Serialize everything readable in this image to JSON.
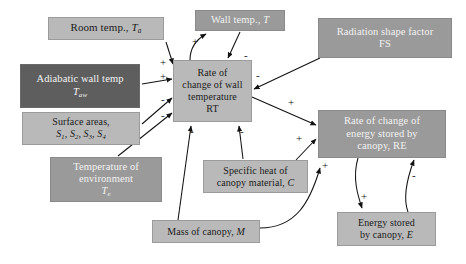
{
  "diagram": {
    "type": "causal-loop-diagram",
    "canvas": {
      "width": 466,
      "height": 264,
      "background": "#ffffff"
    },
    "palette": {
      "light_box": "#b9b9b9",
      "mid_box": "#9a9a9a",
      "dark_box": "#5e5e5e",
      "light_text": "#1b1b1b",
      "inverse_text": "#f4f4f4",
      "arrow": "#111111"
    },
    "nodes": [
      {
        "id": "room_temp",
        "name": "room-temp-node",
        "shade": "light",
        "lines": [
          "Room temp., "
        ],
        "symbol": "T",
        "symbol_sub": "a",
        "x": 48,
        "y": 17,
        "w": 116,
        "h": 23,
        "font": 11
      },
      {
        "id": "wall_temp",
        "name": "wall-temp-node",
        "shade": "mid",
        "lines": [
          "Wall temp., "
        ],
        "symbol": "T",
        "symbol_sub": "",
        "x": 195,
        "y": 10,
        "w": 90,
        "h": 21,
        "font": 10.5
      },
      {
        "id": "radiation_shape_factor",
        "name": "radiation-shape-factor-node",
        "shade": "mid",
        "lines": [
          "Radiation shape factor",
          "FS"
        ],
        "x": 318,
        "y": 18,
        "w": 134,
        "h": 40,
        "font": 10.5
      },
      {
        "id": "adiabatic_wall_temp",
        "name": "adiabatic-wall-temp-node",
        "shade": "dark",
        "lines": [
          "Adiabatic wall temp"
        ],
        "symbol": "T",
        "symbol_sub": "aw",
        "symbol_own_line": true,
        "x": 20,
        "y": 64,
        "w": 120,
        "h": 44,
        "font": 10.5
      },
      {
        "id": "rate_change_wall_temp",
        "name": "rate-of-change-wall-temperature-node",
        "shade": "light",
        "lines": [
          "Rate of",
          "change of wall",
          "temperature",
          "RT"
        ],
        "x": 173,
        "y": 60,
        "w": 79,
        "h": 62,
        "font": 10
      },
      {
        "id": "surface_areas",
        "name": "surface-areas-node",
        "shade": "light",
        "lines": [
          "Surface areas,"
        ],
        "symbols_line": [
          "S",
          "1",
          "S",
          "2",
          "S",
          "3",
          "S",
          "4"
        ],
        "x": 22,
        "y": 112,
        "w": 118,
        "h": 33,
        "font": 10
      },
      {
        "id": "rate_change_energy",
        "name": "rate-of-change-energy-stored-node",
        "shade": "mid",
        "lines": [
          "Rate of change of",
          "energy stored by",
          "canopy, RE"
        ],
        "x": 318,
        "y": 110,
        "w": 128,
        "h": 48,
        "font": 10.5
      },
      {
        "id": "temperature_environment",
        "name": "temperature-of-environment-node",
        "shade": "mid",
        "lines": [
          "Temperature of",
          "environment"
        ],
        "symbol": "T",
        "symbol_sub": "e",
        "symbol_own_line": true,
        "x": 50,
        "y": 157,
        "w": 112,
        "h": 45,
        "font": 10.5
      },
      {
        "id": "specific_heat",
        "name": "specific-heat-canopy-material-node",
        "shade": "light",
        "lines": [
          "Specific heat of",
          "canopy material, "
        ],
        "symbol": "C",
        "symbol_inline": true,
        "x": 203,
        "y": 160,
        "w": 105,
        "h": 33,
        "font": 10
      },
      {
        "id": "mass_canopy",
        "name": "mass-of-canopy-node",
        "shade": "light",
        "lines": [
          "Mass of canopy, "
        ],
        "symbol": "M",
        "symbol_inline": true,
        "x": 152,
        "y": 220,
        "w": 108,
        "h": 23,
        "font": 10
      },
      {
        "id": "energy_stored",
        "name": "energy-stored-by-canopy-node",
        "shade": "light",
        "lines": [
          "Energy stored",
          "by canopy, "
        ],
        "symbol": "E",
        "symbol_inline": true,
        "x": 337,
        "y": 212,
        "w": 99,
        "h": 34,
        "font": 10
      }
    ],
    "links": [
      {
        "id": "l1",
        "name": "link-room-temp-to-rt",
        "from": "room_temp",
        "to": "rate_change_wall_temp",
        "polarity": "+",
        "sign_x": 160,
        "sign_y": 57
      },
      {
        "id": "l2",
        "name": "link-adiabatic-wall-temp-to-rt",
        "from": "adiabatic_wall_temp",
        "to": "rate_change_wall_temp",
        "polarity": "+",
        "sign_x": 160,
        "sign_y": 71
      },
      {
        "id": "l3",
        "name": "link-surface-areas-to-rt",
        "from": "surface_areas",
        "to": "rate_change_wall_temp",
        "polarity": "-",
        "sign_x": 161,
        "sign_y": 94
      },
      {
        "id": "l4",
        "name": "link-temperature-environment-to-rt",
        "from": "temperature_environment",
        "to": "rate_change_wall_temp",
        "polarity": "-",
        "sign_x": 161,
        "sign_y": 110
      },
      {
        "id": "l5",
        "name": "link-rt-to-wall-temp",
        "from": "rate_change_wall_temp",
        "to": "wall_temp",
        "polarity": "+",
        "sign_x": 192,
        "sign_y": 36
      },
      {
        "id": "l6",
        "name": "link-wall-temp-to-rt",
        "from": "wall_temp",
        "to": "rate_change_wall_temp",
        "polarity": "-",
        "sign_x": 244,
        "sign_y": 50
      },
      {
        "id": "l7",
        "name": "link-radiation-shape-factor-to-rt",
        "from": "radiation_shape_factor",
        "to": "rate_change_wall_temp",
        "polarity": "-",
        "sign_x": 256,
        "sign_y": 70
      },
      {
        "id": "l8",
        "name": "link-specific-heat-to-rt",
        "from": "specific_heat",
        "to": "rate_change_wall_temp",
        "polarity": "-",
        "sign_x": 240,
        "sign_y": 126
      },
      {
        "id": "l9",
        "name": "link-mass-canopy-to-rt",
        "from": "mass_canopy",
        "to": "rate_change_wall_temp",
        "polarity": "-",
        "sign_x": 190,
        "sign_y": 126
      },
      {
        "id": "l10",
        "name": "link-rt-to-re",
        "from": "rate_change_wall_temp",
        "to": "rate_change_energy",
        "polarity": "+",
        "sign_x": 288,
        "sign_y": 97
      },
      {
        "id": "l11",
        "name": "link-specific-heat-to-re",
        "from": "specific_heat",
        "to": "rate_change_energy",
        "polarity": "+",
        "sign_x": 296,
        "sign_y": 133
      },
      {
        "id": "l12",
        "name": "link-mass-canopy-to-re",
        "from": "mass_canopy",
        "to": "rate_change_energy",
        "polarity": "+",
        "sign_x": 322,
        "sign_y": 160
      },
      {
        "id": "l13",
        "name": "link-re-to-energy-stored",
        "from": "rate_change_energy",
        "to": "energy_stored",
        "polarity": "+",
        "sign_x": 361,
        "sign_y": 191
      },
      {
        "id": "l14",
        "name": "link-energy-stored-to-re",
        "from": "energy_stored",
        "to": "rate_change_energy",
        "polarity": "-",
        "sign_x": 412,
        "sign_y": 170
      }
    ]
  }
}
